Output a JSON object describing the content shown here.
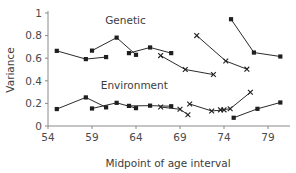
{
  "chart_data": {
    "type": "line",
    "title": "",
    "xlabel": "Midpoint of age interval",
    "ylabel": "Variance",
    "xlim": [
      54,
      81.5
    ],
    "ylim": [
      0,
      1
    ],
    "xticks": [
      54,
      59,
      64,
      69,
      74,
      79
    ],
    "yticks": [
      0,
      0.2,
      0.4,
      0.6,
      0.8,
      1
    ],
    "ytick_labels": [
      "0",
      "0.2",
      "0.4",
      "0.6",
      "0.8",
      "1"
    ],
    "xtick_labels": [
      "54",
      "59",
      "64",
      "69",
      "74",
      "79"
    ],
    "grid": false,
    "legend": "none",
    "annotations": [
      {
        "text": "Genetic",
        "x": 60.5,
        "y": 0.905
      },
      {
        "text": "Environment",
        "x": 60.0,
        "y": 0.325
      }
    ],
    "series": [
      {
        "name": "genetic-square-1",
        "group": "Genetic",
        "marker": "square",
        "points": [
          [
            55.0,
            0.665
          ],
          [
            58.3,
            0.592
          ],
          [
            60.6,
            0.61
          ]
        ]
      },
      {
        "name": "genetic-square-2",
        "group": "Genetic",
        "marker": "square",
        "points": [
          [
            59.0,
            0.667
          ],
          [
            61.8,
            0.782
          ],
          [
            64.0,
            0.63
          ]
        ]
      },
      {
        "name": "genetic-square-3",
        "group": "Genetic",
        "marker": "square",
        "points": [
          [
            63.2,
            0.645
          ],
          [
            65.6,
            0.695
          ],
          [
            68.0,
            0.645
          ]
        ]
      },
      {
        "name": "genetic-cross-1",
        "group": "Genetic",
        "marker": "cross",
        "points": [
          [
            66.8,
            0.623
          ],
          [
            69.6,
            0.5
          ],
          [
            72.8,
            0.455
          ]
        ]
      },
      {
        "name": "genetic-cross-2",
        "group": "Genetic",
        "marker": "cross",
        "points": [
          [
            70.9,
            0.8
          ],
          [
            74.2,
            0.575
          ],
          [
            76.6,
            0.503
          ]
        ]
      },
      {
        "name": "genetic-square-4",
        "group": "Genetic",
        "marker": "square",
        "points": [
          [
            74.8,
            0.945
          ],
          [
            77.4,
            0.65
          ],
          [
            80.4,
            0.615
          ]
        ]
      },
      {
        "name": "environment-square-1",
        "group": "Environment",
        "marker": "square",
        "points": [
          [
            55.0,
            0.15
          ],
          [
            58.3,
            0.253
          ],
          [
            60.6,
            0.165
          ]
        ]
      },
      {
        "name": "environment-square-2",
        "group": "Environment",
        "marker": "square",
        "points": [
          [
            59.0,
            0.155
          ],
          [
            61.8,
            0.205
          ],
          [
            64.0,
            0.158
          ]
        ]
      },
      {
        "name": "environment-square-3",
        "group": "Environment",
        "marker": "square",
        "points": [
          [
            63.2,
            0.178
          ],
          [
            65.6,
            0.18
          ],
          [
            68.0,
            0.175
          ]
        ]
      },
      {
        "name": "environment-cross-1",
        "group": "Environment",
        "marker": "cross",
        "points": [
          [
            66.8,
            0.168
          ],
          [
            69.0,
            0.148
          ],
          [
            69.9,
            0.1
          ]
        ]
      },
      {
        "name": "environment-cross-2",
        "group": "Environment",
        "marker": "cross",
        "points": [
          [
            70.1,
            0.195
          ],
          [
            72.6,
            0.133
          ],
          [
            74.0,
            0.143
          ]
        ]
      },
      {
        "name": "environment-cross-3",
        "group": "Environment",
        "marker": "cross",
        "points": [
          [
            73.6,
            0.143
          ],
          [
            74.7,
            0.152
          ],
          [
            77.0,
            0.298
          ]
        ]
      },
      {
        "name": "environment-square-4",
        "group": "Environment",
        "marker": "square",
        "points": [
          [
            75.1,
            0.073
          ],
          [
            77.8,
            0.152
          ],
          [
            80.4,
            0.208
          ]
        ]
      }
    ]
  }
}
